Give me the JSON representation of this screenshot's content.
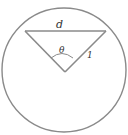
{
  "diagram": {
    "type": "geometry",
    "colors": {
      "stroke": "#8a8a8a",
      "label": "#333333",
      "background": "#ffffff"
    },
    "labels": {
      "chord": "d",
      "angle": "θ",
      "radius": "1"
    },
    "shapes": {
      "circle": {
        "cx": 64,
        "cy": 70,
        "r": 62
      },
      "chord": {
        "x1": 25,
        "y1": 31,
        "x2": 106,
        "y2": 31
      },
      "radius_left": {
        "x1": 25,
        "y1": 31,
        "x2": 65,
        "y2": 72
      },
      "radius_right": {
        "x1": 106,
        "y1": 31,
        "x2": 65,
        "y2": 72
      }
    }
  }
}
